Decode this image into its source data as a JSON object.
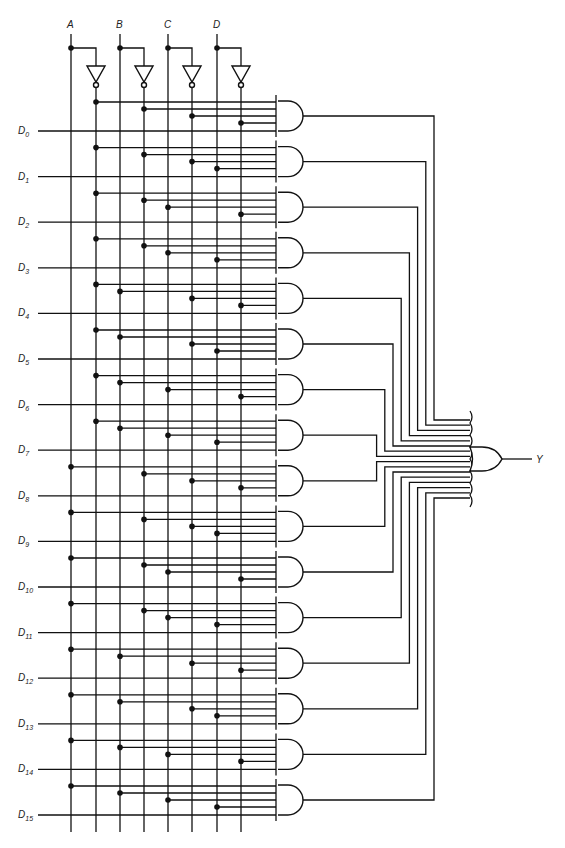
{
  "select_inputs": [
    "A",
    "B",
    "C",
    "D"
  ],
  "data_inputs": [
    {
      "prefix": "D",
      "sub": "0"
    },
    {
      "prefix": "D",
      "sub": "1"
    },
    {
      "prefix": "D",
      "sub": "2"
    },
    {
      "prefix": "D",
      "sub": "3"
    },
    {
      "prefix": "D",
      "sub": "4"
    },
    {
      "prefix": "D",
      "sub": "5"
    },
    {
      "prefix": "D",
      "sub": "6"
    },
    {
      "prefix": "D",
      "sub": "7"
    },
    {
      "prefix": "D",
      "sub": "8"
    },
    {
      "prefix": "D",
      "sub": "9"
    },
    {
      "prefix": "D",
      "sub": "10"
    },
    {
      "prefix": "D",
      "sub": "11"
    },
    {
      "prefix": "D",
      "sub": "12"
    },
    {
      "prefix": "D",
      "sub": "13"
    },
    {
      "prefix": "D",
      "sub": "14"
    },
    {
      "prefix": "D",
      "sub": "15"
    }
  ],
  "output_label": "Y",
  "gates": {
    "and_count": 16,
    "and_inputs": 5,
    "or_inputs": 16,
    "inverters": 4
  },
  "colors": {
    "ink": "#111111",
    "background": "#ffffff"
  }
}
